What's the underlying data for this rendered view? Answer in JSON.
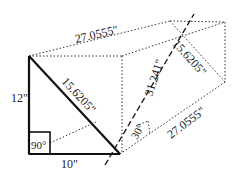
{
  "diagram": {
    "labels": {
      "top_edge": "27.0555\"",
      "hypotenuse": "15.6205\"",
      "right_diagonal": "15.6205\"",
      "dashed_diagonal": "31.241\"",
      "vertical_leg": "12\"",
      "horizontal_leg": "10\"",
      "right_angle": "90°",
      "angle": "30°",
      "bottom_edge": "27.0555\""
    },
    "colors": {
      "stroke": "#111111",
      "dotted": "#333333",
      "background": "#ffffff"
    }
  }
}
